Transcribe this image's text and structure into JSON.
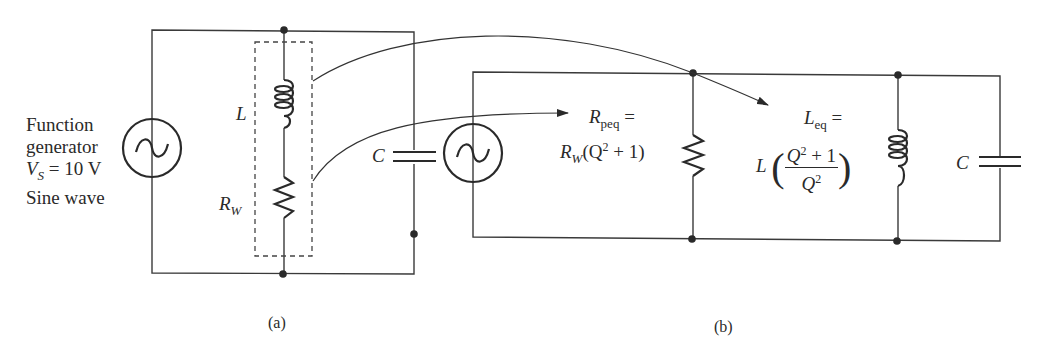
{
  "figure": {
    "panel_a": {
      "label": "(a)",
      "source": {
        "line1": "Function",
        "line2": "generator",
        "voltage_symbol": "V",
        "voltage_subscript": "S",
        "voltage_value": " = 10 V",
        "line4": "Sine wave",
        "icon": "ac-source-icon"
      },
      "inductor_label": "L",
      "resistor_label": "R",
      "resistor_subscript": "W",
      "capacitor_label": "C"
    },
    "panel_b": {
      "label": "(b)",
      "rpeq": {
        "symbol": "R",
        "subscript": "peq",
        "equals": " =",
        "expr_symbol": "R",
        "expr_subscript": "W",
        "expr_open": "(Q",
        "expr_exp": "2",
        "expr_close": " + 1)"
      },
      "leq": {
        "symbol": "L",
        "subscript": "eq",
        "equals": " =",
        "factor": "L",
        "num_base": "Q",
        "num_exp": "2",
        "num_rest": " + 1",
        "den_base": "Q",
        "den_exp": "2",
        "open_paren": "(",
        "close_paren": ")"
      },
      "capacitor_label": "C"
    }
  }
}
